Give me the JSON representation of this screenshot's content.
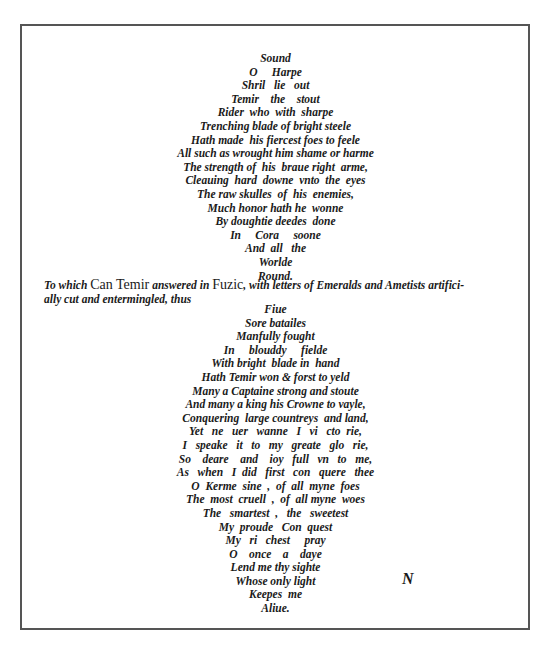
{
  "poem_part1": [
    "Sound",
    "O     Harpe",
    "Shril   lie   out",
    "Temir    the    stout",
    "Rider  who  with  sharpe",
    "Trenching blade of bright steele",
    "Hath made  his fiercest foes to feele",
    "All such as wrought him shame or harme",
    "The strength of  his  braue right  arme,",
    "Cleauing  hard  downe  vnto  the  eyes",
    "The raw skulles  of  his  enemies,",
    "Much honor hath he  wonne",
    "By doughtie deedes  done",
    "In     Cora     soone",
    "And  all   the",
    "Worlde",
    "Round."
  ],
  "prose": {
    "part1": "To which ",
    "name": "Can Temir",
    "part2": " answered in ",
    "fuzic": "Fuzic",
    "part3": ", with letters of Emeralds and Ametists artifici-",
    "line2": "ally cut and entermingled, thus"
  },
  "poem_part2": [
    "Fiue",
    "Sore batailes",
    "Manfully fought",
    "In     blouddy     fielde",
    "With bright  blade in  hand",
    "Hath Temir won & forst to yeld",
    "Many a Captaine strong and stoute",
    "And many a king his Crowne to vayle,",
    "Conquering  large countreys  and land,",
    "Yet   ne   uer   wanne   I   vi   cto  rie,",
    "I   speake   it   to   my   greate   glo   rie,",
    "So    deare    and    ioy   full   vn   to   me,",
    "As   when   I  did   first   con   quere   thee",
    "O  Kerme  sine  ,  of  all  myne  foes",
    "The  most  cruell  ,  of  all myne  woes",
    "The   smartest  ,   the   sweetest",
    "My  proude   Con  quest",
    "My   ri   chest     pray",
    "O    once    a    daye",
    "Lend me thy sighte",
    "Whose only light",
    "Keepes  me",
    "Aliue."
  ],
  "marginal_mark": "N"
}
